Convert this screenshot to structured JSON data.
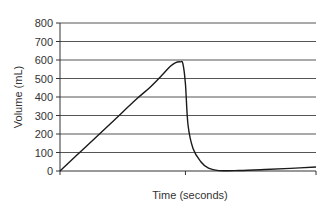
{
  "chart_data": {
    "type": "line",
    "title": "",
    "xlabel": "Time (seconds)",
    "ylabel": "Volume (mL)",
    "ylim": [
      0,
      800
    ],
    "yticks": [
      0,
      100,
      200,
      300,
      400,
      500,
      600,
      700,
      800
    ],
    "xticks_labeled": false,
    "grid": "horizontal",
    "legend": "none",
    "series": [
      {
        "name": "Volume",
        "x": [
          0.0,
          0.1,
          0.2,
          0.3,
          0.35,
          0.4,
          0.43,
          0.45,
          0.47,
          0.48,
          0.49,
          0.5,
          0.52,
          0.55,
          0.58,
          0.62,
          0.7,
          0.8,
          0.9,
          1.0
        ],
        "y": [
          0,
          130,
          260,
          390,
          450,
          520,
          565,
          585,
          590,
          580,
          470,
          250,
          120,
          50,
          15,
          2,
          3,
          8,
          14,
          22
        ]
      }
    ],
    "colors": {
      "line": "#1a1a1a",
      "grid": "#555555",
      "axis": "#333333"
    }
  }
}
